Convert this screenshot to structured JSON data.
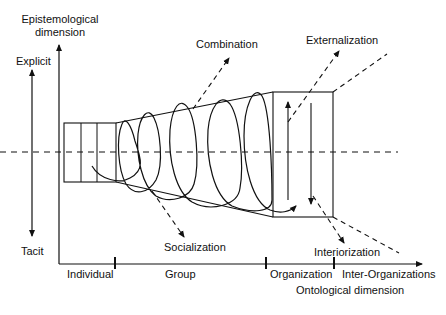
{
  "diagram": {
    "y_axis": {
      "label_line1": "Epistemological",
      "label_line2": "dimension",
      "top_label": "Explicit",
      "bottom_label": "Tacit"
    },
    "x_axis": {
      "label": "Ontological dimension",
      "levels": [
        "Individual",
        "Group",
        "Organization",
        "Inter-Organizations"
      ]
    },
    "processes": {
      "combination": "Combination",
      "externalization": "Externalization",
      "socialization": "Socialization",
      "interiorization": "Interiorization"
    },
    "colors": {
      "line": "#111111",
      "background": "#ffffff"
    }
  }
}
